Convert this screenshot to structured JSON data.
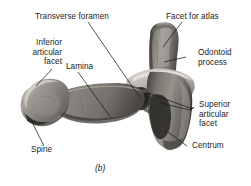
{
  "figure": {
    "caption": "(b)",
    "background_color": "#ffffff",
    "ink_color": "#1c1c1c",
    "bone_tones": {
      "highlight": "#cfcbc6",
      "midtone": "#8e8a85",
      "shadow": "#5a5651",
      "deep_shadow": "#34312e"
    }
  },
  "labels": [
    {
      "id": "transverse-foramen",
      "text": "Transverse foramen",
      "align": "left"
    },
    {
      "id": "facet-for-atlas",
      "text": "Facet for atlas",
      "align": "left"
    },
    {
      "id": "inferior-articular-facet",
      "text": "Inferior\narticular\nfacet",
      "align": "right"
    },
    {
      "id": "lamina",
      "text": "Lamina",
      "align": "left"
    },
    {
      "id": "odontoid-process",
      "text": "Odontoid\nprocess",
      "align": "left"
    },
    {
      "id": "superior-articular-facet",
      "text": "Superior\narticular\nfacet",
      "align": "left"
    },
    {
      "id": "spine",
      "text": "Spine",
      "align": "left"
    },
    {
      "id": "centrum",
      "text": "Centrum",
      "align": "left"
    }
  ]
}
